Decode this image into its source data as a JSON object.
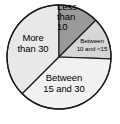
{
  "chart_data": {
    "type": "pie",
    "title": "",
    "subtitle": "",
    "xlabel": "",
    "ylabel": "",
    "legend_position": "none",
    "grid": false,
    "labels_inside_slices": true,
    "categories": [
      "Less than 10",
      "Between 10 and <15",
      "Between 15 and 30",
      "More than 30"
    ],
    "values": [
      12.5,
      13.1,
      36.9,
      37.5
    ],
    "slices": [
      {
        "label": "Less than 10",
        "label_lines": [
          "Less",
          "than",
          "10"
        ],
        "start_angle_deg": 0,
        "end_angle_deg": 45,
        "percent": 12.5,
        "color": "#9a9a9a"
      },
      {
        "label": "Between 10 and <15",
        "label_lines": [
          "Between",
          "10 and <15"
        ],
        "start_angle_deg": 45,
        "end_angle_deg": 92,
        "percent": 13.1,
        "color": "#d6d6d6"
      },
      {
        "label": "Between 15 and 30",
        "label_lines": [
          "Between",
          "15 and 30"
        ],
        "start_angle_deg": 92,
        "end_angle_deg": 225,
        "percent": 36.9,
        "color": "#f1f1f1"
      },
      {
        "label": "More than 30",
        "label_lines": [
          "More",
          "than 30"
        ],
        "start_angle_deg": 225,
        "end_angle_deg": 360,
        "percent": 37.5,
        "color": "#e8e8e8"
      }
    ],
    "geometry": {
      "center_x": 59,
      "center_y": 57,
      "radius": 52
    },
    "colors": {
      "background": "#ffffff",
      "outline": "#1a1a1a",
      "text": "#000000"
    }
  }
}
